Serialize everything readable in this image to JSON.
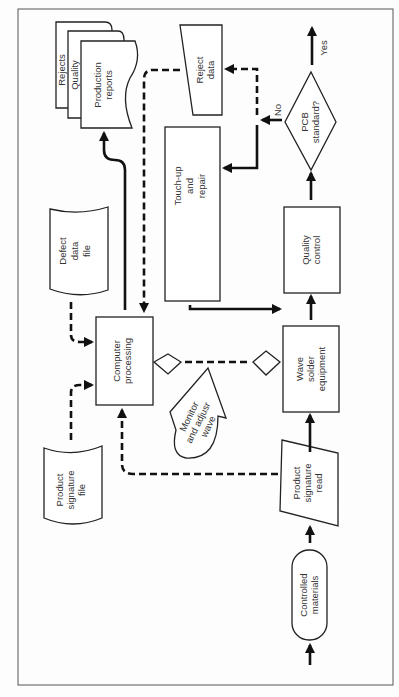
{
  "diagram": {
    "type": "flowchart",
    "orientation": "rotated-90-ccw",
    "nodes": {
      "controlled_materials": {
        "label1": "Controlled",
        "label2": "materials",
        "shape": "terminator"
      },
      "product_signature_read": {
        "label1": "Product",
        "label2": "signature",
        "label3": "read",
        "shape": "manual-input"
      },
      "wave_solder": {
        "label1": "Wave",
        "label2": "solder",
        "label3": "equipment",
        "shape": "process"
      },
      "quality_control": {
        "label1": "Quality",
        "label2": "control",
        "shape": "process"
      },
      "pcb_standard": {
        "label1": "PCB",
        "label2": "standard?",
        "shape": "decision"
      },
      "touch_up": {
        "label1": "Touch-up",
        "label2": "and",
        "label3": "repair",
        "shape": "process"
      },
      "reject_data": {
        "label1": "Reject",
        "label2": "data",
        "shape": "manual-input"
      },
      "computer_processing": {
        "label1": "Computer",
        "label2": "processing",
        "shape": "process"
      },
      "defect_data_file": {
        "label1": "Defect",
        "label2": "data",
        "label3": "file",
        "shape": "stored-data"
      },
      "product_signature_file": {
        "label1": "Product",
        "label2": "signature",
        "label3": "file",
        "shape": "stored-data"
      },
      "monitor_adjust": {
        "label1": "Monitor",
        "label2": "and adjusr",
        "label3": "wave",
        "shape": "display"
      },
      "reports": {
        "page1": "Production",
        "page1b": "reports",
        "page2": "Quality",
        "page3": "Rejects",
        "shape": "multi-document"
      }
    },
    "edges": {
      "yes_label": "Yes",
      "no_label": "No"
    }
  }
}
